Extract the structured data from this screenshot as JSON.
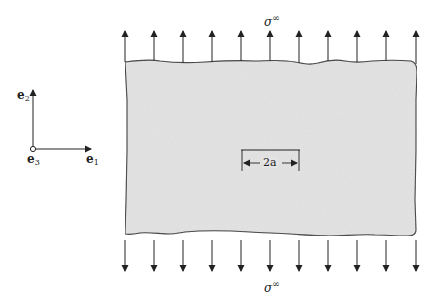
{
  "figure": {
    "type": "mechanics-diagram",
    "colors": {
      "plate_fill": "#e4e4e4",
      "line": "#333333",
      "background": "#ffffff"
    }
  },
  "axes": {
    "e1": {
      "symbol": "e",
      "index": "1"
    },
    "e2": {
      "symbol": "e",
      "index": "2"
    },
    "e3": {
      "symbol": "e",
      "index": "3"
    }
  },
  "load": {
    "top_label": {
      "symbol": "σ",
      "superscript": "∞"
    },
    "bottom_label": {
      "symbol": "σ",
      "superscript": "∞"
    },
    "arrow_count_top": 11,
    "arrow_count_bottom": 11
  },
  "crack": {
    "label": "2a"
  }
}
